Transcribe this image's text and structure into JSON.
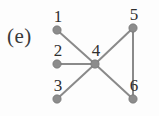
{
  "figure": {
    "panel_label": "(e)",
    "background_color": "#fdfdfd"
  },
  "style": {
    "node_color": "#8c8c8c",
    "node_stroke": "#6f6f6f",
    "edge_color": "#8a8a8a",
    "label_color": "#2f2f2f",
    "panel_label_color": "#3a3a3a",
    "node_radius": 4.2,
    "edge_width": 2.0
  },
  "graph": {
    "type": "undirected-graph",
    "node_count": 6,
    "edge_count": 6,
    "nodes": [
      {
        "id": "1",
        "label": "1",
        "x": 57,
        "y": 30,
        "label_x": 58,
        "label_y": 22
      },
      {
        "id": "2",
        "label": "2",
        "x": 57,
        "y": 64,
        "label_x": 58,
        "label_y": 56
      },
      {
        "id": "3",
        "label": "3",
        "x": 57,
        "y": 99,
        "label_x": 58,
        "label_y": 91
      },
      {
        "id": "4",
        "label": "4",
        "x": 95,
        "y": 64,
        "label_x": 96,
        "label_y": 56
      },
      {
        "id": "5",
        "label": "5",
        "x": 133,
        "y": 28,
        "label_x": 134,
        "label_y": 20
      },
      {
        "id": "6",
        "label": "6",
        "x": 133,
        "y": 99,
        "label_x": 134,
        "label_y": 91
      }
    ],
    "edges": [
      {
        "source": "1",
        "target": "4"
      },
      {
        "source": "2",
        "target": "4"
      },
      {
        "source": "3",
        "target": "4"
      },
      {
        "source": "4",
        "target": "5"
      },
      {
        "source": "4",
        "target": "6"
      },
      {
        "source": "5",
        "target": "6"
      }
    ]
  }
}
